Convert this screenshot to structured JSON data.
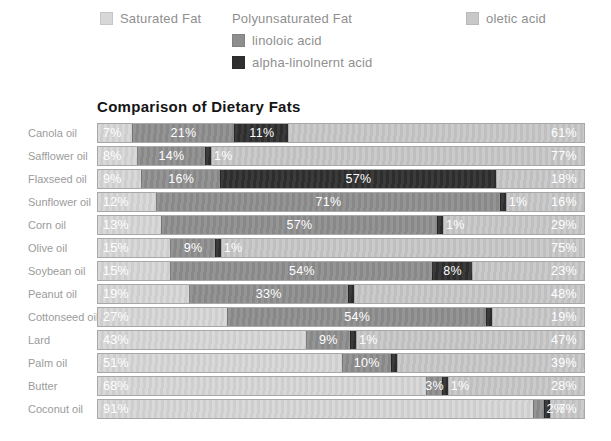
{
  "legend": {
    "poly_header": "Polyunsaturated Fat"
  },
  "colors": {
    "background": "#ffffff",
    "bar_border": "#a8a8a8",
    "value_text": "#ffffff",
    "category_text": "#9b9b9b",
    "legend_text": "#8f8f8f",
    "title_text": "#141414"
  },
  "chart_data": {
    "type": "bar",
    "stacked": true,
    "orientation": "horizontal",
    "title": "Comparison of Dietary Fats",
    "value_unit": "%",
    "axis_range": [
      0,
      100
    ],
    "grid": false,
    "legend_position": "top",
    "categories": [
      "Canola oil",
      "Safflower oil",
      "Flaxseed oil",
      "Sunflower oil",
      "Corn oil",
      "Olive oil",
      "Soybean oil",
      "Peanut oil",
      "Cottonseed oil",
      "Lard",
      "Palm oil",
      "Butter",
      "Coconut oil"
    ],
    "series": [
      {
        "name": "Saturated Fat",
        "key": "saturated-fat",
        "color": "#d7d7d7",
        "values": [
          7,
          8,
          9,
          12,
          13,
          15,
          15,
          19,
          27,
          43,
          51,
          68,
          91
        ]
      },
      {
        "name": "linoloic acid",
        "key": "linoloic-acid",
        "color": "#8e8e8e",
        "values": [
          21,
          14,
          16,
          71,
          57,
          9,
          54,
          33,
          54,
          9,
          10,
          3,
          2
        ]
      },
      {
        "name": "alpha-linolnernt acid",
        "key": "alpha-linolnernt-acid",
        "color": "#2f2f2f",
        "values": [
          11,
          1,
          57,
          1,
          1,
          1,
          8,
          0,
          0,
          1,
          0,
          1,
          0
        ]
      },
      {
        "name": "oletic acid",
        "key": "oletic-acid",
        "color": "#c8c8c8",
        "values": [
          61,
          77,
          18,
          16,
          29,
          75,
          23,
          48,
          19,
          47,
          39,
          28,
          7
        ]
      }
    ]
  }
}
